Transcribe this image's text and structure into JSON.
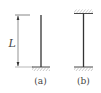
{
  "figure": {
    "panels": [
      {
        "id": "a",
        "label": "(a)",
        "description": "Cantilever column: fixed at base, free at top"
      },
      {
        "id": "b",
        "label": "(b)",
        "description": "Column fixed at both top and bottom"
      }
    ],
    "dimension": {
      "label": "L"
    },
    "colors": {
      "line": "#333333",
      "hatch": "#666666",
      "text": "#444444"
    }
  }
}
